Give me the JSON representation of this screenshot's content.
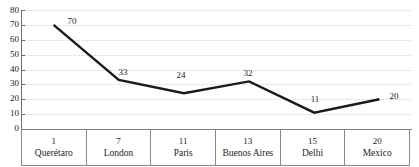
{
  "chart_data": {
    "type": "line",
    "title": "",
    "xlabel": "",
    "ylabel": "",
    "ylim": [
      0,
      80
    ],
    "ytick_step": 10,
    "yticks": [
      "0",
      "10",
      "20",
      "30",
      "40",
      "50",
      "60",
      "70",
      "80"
    ],
    "grid": true,
    "legend": "none",
    "categories": [
      "Querétaro",
      "London",
      "Paris",
      "Buenos Aires",
      "Delhi",
      "Mexico"
    ],
    "ranks": [
      "1",
      "7",
      "11",
      "13",
      "15",
      "20"
    ],
    "values": [
      70,
      33,
      24,
      32,
      11,
      20
    ],
    "value_labels": [
      "70",
      "33",
      "24",
      "32",
      "11",
      "20"
    ],
    "series": [
      {
        "name": "",
        "values": [
          70,
          33,
          24,
          32,
          11,
          20
        ],
        "color": "#1a1a1a"
      }
    ],
    "table": {
      "columns": [
        {
          "rank": "1",
          "name": "Querétaro"
        },
        {
          "rank": "7",
          "name": "London"
        },
        {
          "rank": "11",
          "name": "Paris"
        },
        {
          "rank": "13",
          "name": "Buenos Aires"
        },
        {
          "rank": "15",
          "name": "Delhi"
        },
        {
          "rank": "20",
          "name": "Mexico"
        }
      ]
    },
    "colors": {
      "line": "#1a1a1a",
      "axis": "#6e6e6e",
      "grid": "#d2d2d2",
      "table_border": "#8a8a8a",
      "text": "#1c1c1c",
      "background": "#ffffff"
    }
  }
}
